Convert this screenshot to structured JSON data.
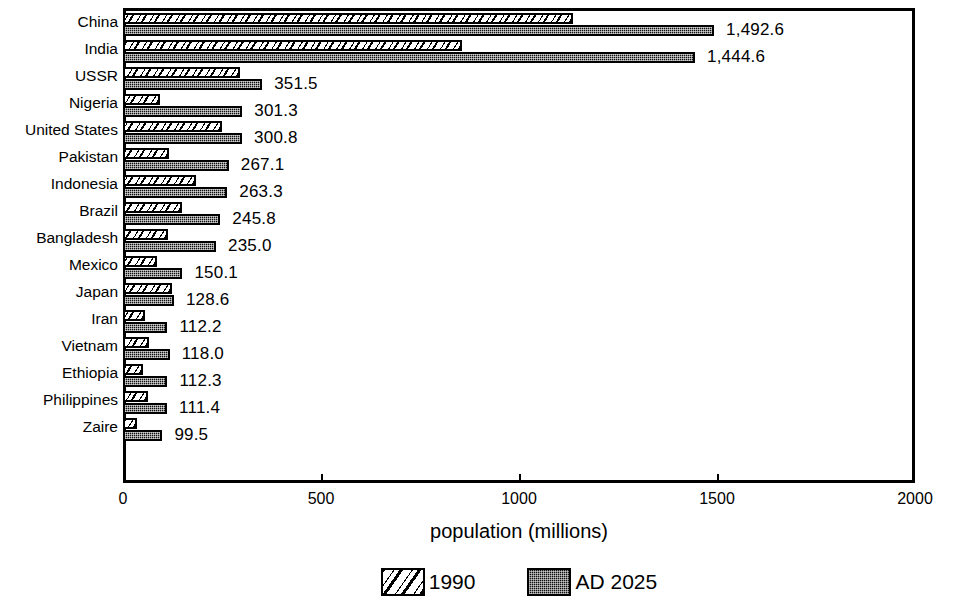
{
  "chart_data": {
    "type": "bar",
    "orientation": "horizontal",
    "title": "",
    "xlabel": "population (millions)",
    "ylabel": "",
    "xlim": [
      0,
      2000
    ],
    "xticks": [
      0,
      500,
      1000,
      1500,
      2000
    ],
    "xticklabels": [
      "0",
      "500",
      "1000",
      "1500",
      "2000"
    ],
    "grid": false,
    "legend_position": "bottom-center",
    "categories": [
      "China",
      "India",
      "USSR",
      "Nigeria",
      "United States",
      "Pakistan",
      "Indonesia",
      "Brazil",
      "Bangladesh",
      "Mexico",
      "Japan",
      "Iran",
      "Vietnam",
      "Ethiopia",
      "Philippines",
      "Zaire"
    ],
    "series": [
      {
        "name": "1990",
        "pattern": "diagonal-hatch",
        "values": [
          1136.0,
          856.0,
          295.0,
          93.0,
          250.0,
          115.0,
          185.0,
          150.0,
          114.0,
          86.0,
          124.0,
          56.0,
          66.0,
          50.0,
          62.0,
          36.0
        ]
      },
      {
        "name": "AD 2025",
        "pattern": "dense-dot-fill",
        "values": [
          1492.6,
          1444.6,
          351.5,
          301.3,
          300.8,
          267.1,
          263.3,
          245.8,
          235.0,
          150.1,
          128.6,
          112.2,
          118.0,
          112.3,
          111.4,
          99.5
        ]
      }
    ],
    "value_labels": [
      "1,492.6",
      "1,444.6",
      "351.5",
      "301.3",
      "300.8",
      "267.1",
      "263.3",
      "245.8",
      "235.0",
      "150.1",
      "128.6",
      "112.2",
      "118.0",
      "112.3",
      "111.4",
      "99.5"
    ],
    "colors": {
      "bar_outline": "#000000",
      "bar_1990_fill": "#ffffff",
      "bar_2025_fill": "#111111",
      "axis": "#000000",
      "background": "#ffffff",
      "text": "#000000"
    }
  },
  "legend": {
    "entries": [
      {
        "label": "1990",
        "swatch": "hatch-swatch-icon"
      },
      {
        "label": "AD 2025",
        "swatch": "dotfill-swatch-icon"
      }
    ]
  }
}
